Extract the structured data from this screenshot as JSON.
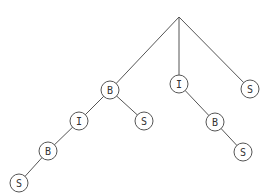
{
  "diagram": {
    "type": "tree",
    "root": {
      "id": "root",
      "x": 179,
      "y": 17
    },
    "nodes": [
      {
        "id": "n1",
        "label": "B",
        "x": 110,
        "y": 90
      },
      {
        "id": "n2",
        "label": "I",
        "x": 179,
        "y": 84
      },
      {
        "id": "n3",
        "label": "S",
        "x": 250,
        "y": 89
      },
      {
        "id": "n4",
        "label": "I",
        "x": 79,
        "y": 121
      },
      {
        "id": "n5",
        "label": "S",
        "x": 144,
        "y": 121
      },
      {
        "id": "n6",
        "label": "B",
        "x": 48,
        "y": 151
      },
      {
        "id": "n7",
        "label": "S",
        "x": 19,
        "y": 183
      },
      {
        "id": "n8",
        "label": "B",
        "x": 215,
        "y": 122
      },
      {
        "id": "n9",
        "label": "S",
        "x": 243,
        "y": 152
      }
    ],
    "edges": [
      [
        "root",
        "n1"
      ],
      [
        "root",
        "n2"
      ],
      [
        "root",
        "n3"
      ],
      [
        "n1",
        "n4"
      ],
      [
        "n1",
        "n5"
      ],
      [
        "n4",
        "n6"
      ],
      [
        "n6",
        "n7"
      ],
      [
        "n2",
        "n8"
      ],
      [
        "n8",
        "n9"
      ]
    ],
    "node_radius": 9
  }
}
